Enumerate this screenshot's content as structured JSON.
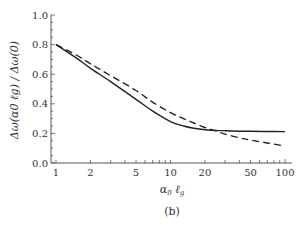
{
  "chart_data": {
    "type": "line",
    "title": "",
    "panel_label": "(b)",
    "xlabel": "α0 ℓg",
    "xlabel_parts": {
      "main": "α",
      "sub1": "0",
      "mid": " ℓ",
      "sub2": "g"
    },
    "ylabel": "Δω(α0 ℓg) / Δω(0)",
    "xscale": "log",
    "xlim": [
      1,
      100
    ],
    "ylim": [
      0.0,
      1.0
    ],
    "x_ticks": [
      1,
      2,
      5,
      10,
      20,
      50,
      100
    ],
    "x_tick_labels": [
      "1",
      "2",
      "5",
      "10",
      "20",
      "50",
      "100"
    ],
    "y_ticks": [
      0.0,
      0.2,
      0.4,
      0.6,
      0.8,
      1.0
    ],
    "y_tick_labels": [
      "0.0",
      "0.2",
      "0.4",
      "0.6",
      "0.8",
      "1.0"
    ],
    "grid": false,
    "legend": null,
    "series": [
      {
        "name": "solid",
        "style": "solid",
        "color": "#222222",
        "x": [
          1,
          1.5,
          2,
          3,
          5,
          7,
          10,
          13,
          16,
          20,
          25,
          30,
          40,
          50,
          70,
          100
        ],
        "values": [
          0.8,
          0.71,
          0.64,
          0.55,
          0.43,
          0.35,
          0.28,
          0.25,
          0.235,
          0.225,
          0.22,
          0.218,
          0.215,
          0.214,
          0.213,
          0.212
        ]
      },
      {
        "name": "dashed",
        "style": "dashed",
        "color": "#222222",
        "x": [
          1,
          1.5,
          2,
          3,
          5,
          7,
          10,
          13,
          16,
          20,
          25,
          30,
          40,
          50,
          70,
          100
        ],
        "values": [
          0.8,
          0.73,
          0.67,
          0.59,
          0.49,
          0.41,
          0.34,
          0.3,
          0.27,
          0.24,
          0.215,
          0.195,
          0.17,
          0.155,
          0.135,
          0.115
        ]
      }
    ]
  }
}
